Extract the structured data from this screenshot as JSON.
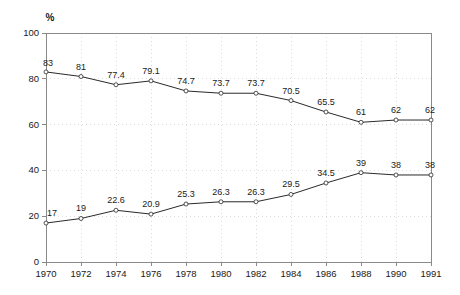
{
  "chart_data": {
    "type": "line",
    "title": "",
    "subtitle": "",
    "xlabel": "",
    "ylabel": "%",
    "unit_label": "%",
    "categories": [
      "1970",
      "1972",
      "1974",
      "1976",
      "1978",
      "1980",
      "1982",
      "1984",
      "1986",
      "1988",
      "1990",
      "1991"
    ],
    "ylim": [
      0,
      100
    ],
    "y_ticks": [
      0,
      20,
      40,
      60,
      80,
      100
    ],
    "y_tick_labels": [
      "0",
      "20",
      "40",
      "60",
      "80",
      "100"
    ],
    "grid": true,
    "grid_style": "dotted",
    "legend": false,
    "legend_position": "none",
    "marker": "open-circle",
    "data_labels": true,
    "series": [
      {
        "name": "upper",
        "values": [
          83,
          81,
          77.4,
          79.1,
          74.7,
          73.7,
          73.7,
          70.5,
          65.5,
          61,
          62,
          62
        ],
        "labels": [
          "83",
          "81",
          "77.4",
          "79.1",
          "74.7",
          "73.7",
          "73.7",
          "70.5",
          "65.5",
          "61",
          "62",
          "62"
        ]
      },
      {
        "name": "lower",
        "values": [
          17,
          19,
          22.6,
          20.9,
          25.3,
          26.3,
          26.3,
          29.5,
          34.5,
          39,
          38,
          38
        ],
        "labels": [
          "17",
          "19",
          "22.6",
          "20.9",
          "25.3",
          "26.3",
          "26.3",
          "29.5",
          "34.5",
          "39",
          "38",
          "38"
        ]
      }
    ]
  },
  "colors": {
    "line": "#2a2a2a",
    "axis": "#8a8a8a",
    "grid": "#cfcfcf",
    "text": "#1a1a1a",
    "background": "#ffffff"
  }
}
